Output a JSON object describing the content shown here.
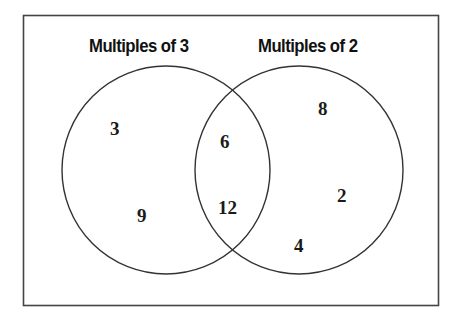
{
  "diagram": {
    "type": "venn",
    "sets": [
      {
        "id": "left",
        "title": "Multiples of 3",
        "only_elements": [
          "3",
          "9"
        ]
      },
      {
        "id": "right",
        "title": "Multiples of 2",
        "only_elements": [
          "8",
          "2",
          "4"
        ]
      }
    ],
    "intersection": {
      "elements": [
        "6",
        "12"
      ]
    },
    "colors": {
      "stroke": "#333333",
      "frame": "#444444",
      "background": "#ffffff",
      "text": "#111111"
    }
  }
}
